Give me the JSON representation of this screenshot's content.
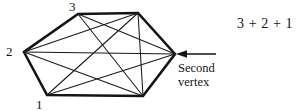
{
  "figure": {
    "type": "polygon-diagonals-diagram",
    "shape": "hexagon",
    "stroke_color": "#141414",
    "background_color": "#ffffff",
    "vertex_labels": [
      {
        "id": "v3",
        "text": "3",
        "x": 78,
        "y": 14
      },
      {
        "id": "v2",
        "text": "2",
        "x": 24,
        "y": 52
      },
      {
        "id": "v1",
        "text": "1",
        "x": 47,
        "y": 95
      }
    ],
    "vertices": [
      {
        "id": "top-left",
        "x": 78,
        "y": 14
      },
      {
        "id": "top-right",
        "x": 138,
        "y": 13
      },
      {
        "id": "right",
        "x": 175,
        "y": 54
      },
      {
        "id": "bottom-right",
        "x": 143,
        "y": 96
      },
      {
        "id": "bottom-left",
        "x": 47,
        "y": 95
      },
      {
        "id": "left",
        "x": 24,
        "y": 52
      }
    ],
    "annotation": {
      "line1": "Second",
      "line2": "vertex",
      "arrow_from_x": 216,
      "arrow_to_x": 178,
      "arrow_y": 54
    },
    "formula": "3 + 2 + 1"
  }
}
